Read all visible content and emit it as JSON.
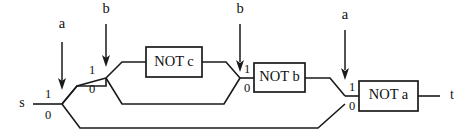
{
  "figure": {
    "kind": "automaton-transition-diagram",
    "background_color": "#ffffff",
    "line_color": "#1a1a1a",
    "text_color": "#111111",
    "width": 467,
    "height": 136
  },
  "terminals": {
    "start": "s",
    "end": "t"
  },
  "gates": [
    {
      "id": "not-c",
      "label": "NOT c"
    },
    {
      "id": "not-b",
      "label": "NOT b"
    },
    {
      "id": "not-a",
      "label": "NOT a"
    }
  ],
  "input_arrows": [
    {
      "id": "arrow-1",
      "label": "a"
    },
    {
      "id": "arrow-2",
      "label": "b"
    },
    {
      "id": "arrow-3",
      "label": "b"
    },
    {
      "id": "arrow-4",
      "label": "a"
    }
  ],
  "branch_points": [
    {
      "id": "branch-1",
      "top_digit": "1",
      "bottom_digit": "0"
    },
    {
      "id": "branch-2",
      "top_digit": "1",
      "bottom_digit": "0"
    },
    {
      "id": "branch-3",
      "top_digit": "1",
      "bottom_digit": "0"
    },
    {
      "id": "branch-4",
      "top_digit": "1",
      "bottom_digit": "0"
    }
  ]
}
